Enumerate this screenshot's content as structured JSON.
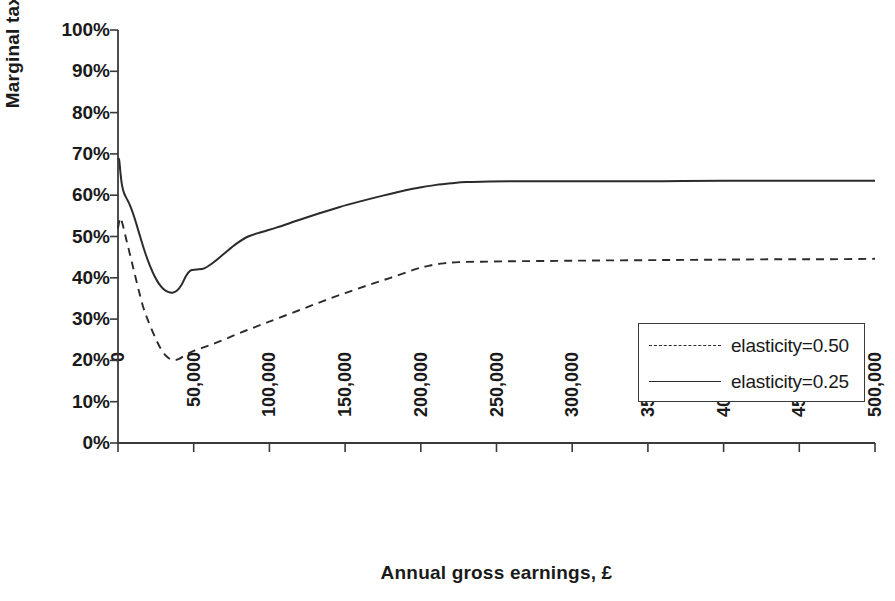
{
  "chart_data": {
    "type": "line",
    "title": "",
    "xlabel": "Annual gross earnings, £",
    "ylabel": "Marginal tax rate",
    "xlim": [
      0,
      500000
    ],
    "ylim": [
      0,
      1.0
    ],
    "grid": false,
    "legend_position": "right-lower",
    "x_tick_labels": [
      "0",
      "50,000",
      "100,000",
      "150,000",
      "200,000",
      "250,000",
      "300,000",
      "350,000",
      "400,000",
      "450,000",
      "500,000"
    ],
    "x_tick_values": [
      0,
      50000,
      100000,
      150000,
      200000,
      250000,
      300000,
      350000,
      400000,
      450000,
      500000
    ],
    "y_tick_labels": [
      "0%",
      "10%",
      "20%",
      "30%",
      "40%",
      "50%",
      "60%",
      "70%",
      "80%",
      "90%",
      "100%"
    ],
    "y_tick_values": [
      0,
      10,
      20,
      30,
      40,
      50,
      60,
      70,
      80,
      90,
      100
    ],
    "series": [
      {
        "name": "elasticity=0.50",
        "style": "dashed",
        "color": "#2b2b2b",
        "x": [
          0,
          1500,
          3000,
          5000,
          7000,
          9000,
          11000,
          14000,
          17000,
          20000,
          24000,
          28000,
          32000,
          36000,
          40000,
          45000,
          50000,
          57000,
          65000,
          75000,
          85000,
          95000,
          105000,
          120000,
          135000,
          150000,
          165000,
          180000,
          195000,
          205000,
          215000,
          225000,
          240000,
          260000,
          290000,
          320000,
          360000,
          400000,
          440000,
          470000,
          500000
        ],
        "y": [
          52.0,
          54.5,
          53.0,
          50.0,
          47.0,
          44.0,
          41.0,
          36.5,
          32.5,
          29.5,
          26.0,
          23.0,
          21.0,
          20.1,
          20.3,
          21.4,
          22.3,
          23.2,
          24.3,
          25.8,
          27.3,
          28.7,
          30.1,
          32.2,
          34.3,
          36.3,
          38.2,
          40.0,
          41.9,
          42.9,
          43.5,
          43.8,
          43.9,
          44.0,
          44.1,
          44.2,
          44.3,
          44.4,
          44.5,
          44.5,
          44.6
        ]
      },
      {
        "name": "elasticity=0.25",
        "style": "solid",
        "color": "#2b2b2b",
        "x": [
          0,
          800,
          1600,
          2600,
          4000,
          6000,
          8000,
          10000,
          12000,
          15000,
          18000,
          21000,
          24000,
          27000,
          30000,
          33000,
          36000,
          39000,
          42000,
          45000,
          48000,
          52000,
          57000,
          63000,
          70000,
          78000,
          86000,
          95000,
          105000,
          118000,
          132000,
          146000,
          160000,
          175000,
          190000,
          200000,
          210000,
          220000,
          230000,
          245000,
          265000,
          290000,
          320000,
          360000,
          400000,
          450000,
          500000
        ],
        "y": [
          69.0,
          68.5,
          65.5,
          62.5,
          60.5,
          59.0,
          57.5,
          55.5,
          53.2,
          49.5,
          46.0,
          43.0,
          40.5,
          38.6,
          37.3,
          36.6,
          36.4,
          36.9,
          38.3,
          40.5,
          41.8,
          42.0,
          42.3,
          43.7,
          45.8,
          48.2,
          50.0,
          51.1,
          52.2,
          53.8,
          55.5,
          57.1,
          58.5,
          59.9,
          61.2,
          61.9,
          62.5,
          62.9,
          63.2,
          63.3,
          63.4,
          63.4,
          63.4,
          63.4,
          63.5,
          63.5,
          63.5
        ]
      }
    ]
  },
  "legend": {
    "entries": [
      {
        "label": "elasticity=0.50",
        "style": "dashed"
      },
      {
        "label": "elasticity=0.25",
        "style": "solid"
      }
    ]
  },
  "axes": {
    "x_title": "Annual gross earnings, £",
    "y_title": "Marginal tax rate"
  }
}
